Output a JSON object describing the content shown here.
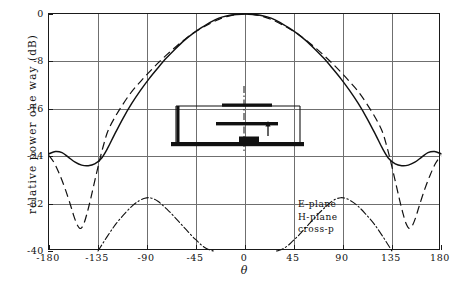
{
  "chart_data": {
    "type": "line",
    "title": "",
    "xlabel": "θ",
    "ylabel": "relative power one way (dB)",
    "xlim": [
      -180,
      180
    ],
    "ylim": [
      -40,
      0
    ],
    "grid": true,
    "xticks": [
      -180,
      -135,
      -90,
      -45,
      0,
      45,
      90,
      135,
      180
    ],
    "xticklabels": [
      "-180",
      "-135",
      "-90",
      "-45",
      "0",
      "45",
      "90",
      "135",
      "180"
    ],
    "yticks": [
      0,
      -8,
      -16,
      -24,
      -32,
      -40
    ],
    "yticklabels": [
      "0",
      "-8",
      "-16",
      "-24",
      "-32",
      "-40"
    ],
    "legend_position": "lower-right-inside",
    "series": [
      {
        "name": "E-plane",
        "style": "solid",
        "x": [
          -180,
          -174,
          -168,
          -162,
          -156,
          -150,
          -144,
          -138,
          -132,
          -126,
          -120,
          -112,
          -104,
          -96,
          -88,
          -80,
          -72,
          -64,
          -56,
          -48,
          -40,
          -32,
          -24,
          -16,
          -8,
          0,
          8,
          16,
          24,
          32,
          40,
          48,
          56,
          64,
          72,
          80,
          88,
          96,
          104,
          112,
          120,
          126,
          132,
          138,
          144,
          150,
          156,
          162,
          168,
          174,
          180
        ],
        "y": [
          -23.6,
          -23.2,
          -23.4,
          -24.2,
          -25.0,
          -25.5,
          -25.6,
          -25.3,
          -24.4,
          -22.6,
          -20.4,
          -17.6,
          -15.1,
          -12.9,
          -10.9,
          -9.1,
          -7.4,
          -5.9,
          -4.5,
          -3.3,
          -2.3,
          -1.4,
          -0.7,
          -0.3,
          -0.1,
          0.0,
          -0.1,
          -0.3,
          -0.7,
          -1.4,
          -2.3,
          -3.3,
          -4.5,
          -5.9,
          -7.4,
          -9.1,
          -10.9,
          -12.9,
          -15.1,
          -17.6,
          -20.4,
          -22.6,
          -24.4,
          -25.3,
          -25.6,
          -25.5,
          -25.0,
          -24.2,
          -23.4,
          -23.2,
          -23.6
        ]
      },
      {
        "name": "H-plane",
        "style": "dashed",
        "x": [
          -180,
          -175,
          -170,
          -165,
          -160,
          -157,
          -154,
          -151,
          -148,
          -145,
          -142,
          -139,
          -136,
          -133,
          -130,
          -126,
          -120,
          -112,
          -104,
          -96,
          -88,
          -80,
          -72,
          -64,
          -56,
          -48,
          -40,
          -32,
          -24,
          -16,
          -8,
          0,
          8,
          16,
          24,
          32,
          40,
          48,
          56,
          64,
          72,
          80,
          88,
          96,
          104,
          112,
          120,
          126,
          130,
          133,
          136,
          139,
          142,
          145,
          148,
          151,
          154,
          157,
          160,
          165,
          170,
          175,
          180
        ],
        "y": [
          -23.9,
          -25.2,
          -27.2,
          -29.6,
          -32.4,
          -34.2,
          -35.6,
          -36.2,
          -35.4,
          -33.6,
          -31.4,
          -29.0,
          -26.6,
          -24.3,
          -22.2,
          -19.8,
          -17.6,
          -15.2,
          -13.1,
          -11.4,
          -9.8,
          -8.3,
          -6.9,
          -5.6,
          -4.4,
          -3.3,
          -2.4,
          -1.6,
          -0.9,
          -0.4,
          -0.1,
          0.0,
          -0.1,
          -0.4,
          -0.9,
          -1.6,
          -2.4,
          -3.3,
          -4.4,
          -5.6,
          -6.9,
          -8.3,
          -9.8,
          -11.4,
          -13.1,
          -15.2,
          -17.6,
          -19.8,
          -22.2,
          -24.3,
          -26.6,
          -29.0,
          -31.4,
          -33.6,
          -35.4,
          -36.2,
          -35.6,
          -34.2,
          -32.4,
          -29.6,
          -27.2,
          -25.2,
          -23.9
        ]
      },
      {
        "name": "cross-p",
        "style": "dashdot",
        "x": [
          -135,
          -126,
          -118,
          -110,
          -103,
          -97,
          -92,
          -88,
          -84,
          -80,
          -76,
          -72,
          -68,
          -64,
          -60,
          -56,
          -52,
          -48,
          -44,
          -40,
          -37,
          -34,
          -31,
          -29,
          29,
          31,
          34,
          37,
          40,
          44,
          48,
          52,
          56,
          60,
          64,
          68,
          72,
          76,
          80,
          84,
          88,
          92,
          97,
          103,
          110,
          118,
          126,
          135
        ],
        "y": [
          -40.0,
          -37.4,
          -35.3,
          -33.6,
          -32.3,
          -31.5,
          -31.1,
          -31.0,
          -31.2,
          -31.6,
          -32.2,
          -32.9,
          -33.6,
          -34.4,
          -35.2,
          -36.0,
          -36.8,
          -37.6,
          -38.3,
          -39.0,
          -39.4,
          -39.7,
          -39.9,
          -40.0,
          -40.0,
          -39.9,
          -39.7,
          -39.4,
          -39.0,
          -38.3,
          -37.6,
          -36.8,
          -36.0,
          -35.2,
          -34.4,
          -33.6,
          -32.9,
          -32.2,
          -31.6,
          -31.2,
          -31.0,
          -31.1,
          -31.5,
          -32.3,
          -33.6,
          -35.3,
          -37.4,
          -40.0
        ]
      }
    ],
    "legend_entries": [
      "E-plane",
      "H-plane",
      "cross-p"
    ],
    "annotations": {
      "inset": {
        "name": "stacked-patch-antenna-cross-section",
        "description": "cross-sectional schematic of a stacked microstrip patch antenna with upper patch, lower patch, substrate cavity outline, ground plane, feed block and probe arrow, with a vertical dash-dot symmetry axis"
      }
    },
    "colors": {
      "curve": "#111111",
      "grid": "#6f6f6f",
      "frame": "#1a1a1a",
      "background": "#ffffff"
    }
  }
}
